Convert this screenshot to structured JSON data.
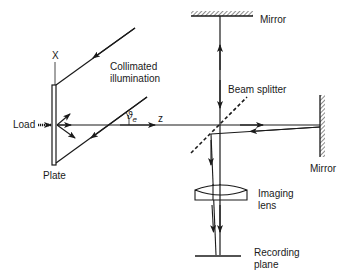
{
  "labels": {
    "x_axis": "X",
    "z_axis": "z",
    "collimated_line1": "Collimated",
    "collimated_line2": "illumination",
    "load": "Load",
    "plate": "Plate",
    "theta": "ϑ",
    "theta_sub": "e",
    "top_mirror": "Mirror",
    "right_mirror": "Mirror",
    "beam_splitter": "Beam splitter",
    "lens_line1": "Imaging",
    "lens_line2": "lens",
    "recording_line1": "Recording",
    "recording_line2": "plane"
  },
  "colors": {
    "ink": "#1a1a1a",
    "background": "#ffffff"
  }
}
